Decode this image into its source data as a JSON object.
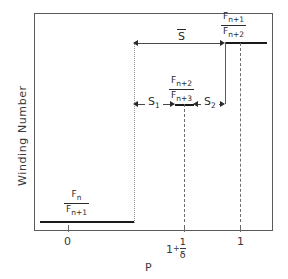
{
  "figure": {
    "type": "diagram",
    "axes": {
      "x_label": "P",
      "y_label": "Winding  Number",
      "x_ticks": [
        {
          "value": "0",
          "text": "0",
          "x_px": 68
        },
        {
          "value": "1+1/delta",
          "text": "1",
          "plus": "+",
          "frac_num": "1",
          "frac_den": "δ",
          "x_px": 184
        },
        {
          "value": "1",
          "text": "1",
          "x_px": 240
        }
      ]
    },
    "plateaus": [
      {
        "name": "lower-plateau",
        "num": "F",
        "num_sub": "n",
        "den": "F",
        "den_sub": "n+1"
      },
      {
        "name": "middle-plateau",
        "num": "F",
        "num_sub": "n+2",
        "den": "F",
        "den_sub": "n+3"
      },
      {
        "name": "upper-plateau",
        "num": "F",
        "num_sub": "n+1",
        "den": "F",
        "den_sub": "n+2"
      }
    ],
    "intervals": [
      {
        "name": "S-bar",
        "label": "S",
        "overbar": true
      },
      {
        "name": "S1",
        "label": "S",
        "sub": "1",
        "overbar": false
      },
      {
        "name": "S2",
        "label": "S",
        "sub": "2",
        "overbar": false
      }
    ],
    "colors": {
      "frame": "#5a5a5a",
      "curve": "#1a1a1a",
      "dotted": "#8d8d8d",
      "dashed": "#6e6e6e",
      "text": "#2b2b2b"
    }
  }
}
